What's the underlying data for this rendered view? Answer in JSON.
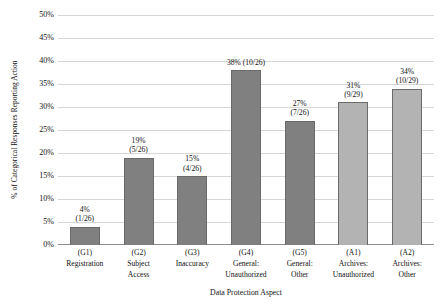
{
  "chart_data": {
    "type": "bar",
    "title": "",
    "xlabel": "Data Protection Aspect",
    "ylabel": "% of Categorical Responses Reporting Action",
    "ylim": [
      0,
      50
    ],
    "ytick_values": [
      0,
      5,
      10,
      15,
      20,
      25,
      30,
      35,
      40,
      45,
      50
    ],
    "ytick_labels": [
      "0%",
      "5%",
      "10%",
      "15%",
      "20%",
      "25%",
      "30%",
      "35%",
      "40%",
      "45%",
      "50%"
    ],
    "grid": true,
    "legend": "none",
    "categories": [
      "(G1)",
      "(G2)",
      "(G3)",
      "(G4)",
      "(G5)",
      "(A1)",
      "(A2)"
    ],
    "category_names": [
      "Registration",
      "Subject\nAccess",
      "Inaccuracy",
      "General:\nUnauthorized",
      "General:\nOther",
      "Archives:\nUnauthorized",
      "Archives:\nOther"
    ],
    "values": [
      4,
      19,
      15,
      38,
      27,
      31,
      34
    ],
    "data_labels": [
      "4%\n(1/26)",
      "19%\n(5/26)",
      "15%\n(4/26)",
      "38% (10/26)",
      "27%\n(7/26)",
      "31%\n(9/29)",
      "34%\n(10/29)"
    ],
    "fractions": [
      "1/26",
      "5/26",
      "4/26",
      "10/26",
      "7/26",
      "9/29",
      "10/29"
    ],
    "numerators": [
      1,
      5,
      4,
      10,
      7,
      9,
      10
    ],
    "denominators": [
      26,
      26,
      26,
      26,
      26,
      29,
      29
    ],
    "series_groups": [
      "General",
      "General",
      "General",
      "General",
      "General",
      "Archives",
      "Archives"
    ],
    "bar_colors": [
      "#808080",
      "#808080",
      "#808080",
      "#808080",
      "#808080",
      "#b3b3b3",
      "#b3b3b3"
    ]
  },
  "colors": {
    "background": "#ffffff",
    "gridline": "#d6d6d6",
    "axis_line": "#8e8e8e",
    "bar_general": "#808080",
    "bar_archives": "#b3b3b3",
    "bar_border": "#6a6a6a",
    "text": "#111111"
  }
}
